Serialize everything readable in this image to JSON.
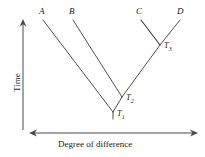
{
  "figure": {
    "type": "phylogenetic-tree",
    "stroke_color": "#3a3a3a",
    "text_color": "#1a1a1a",
    "background": "#ffffff"
  },
  "axes": {
    "vertical": {
      "label": "Time",
      "direction": "up",
      "arrow": "single",
      "x": 23,
      "y_top": 20,
      "y_bottom": 130
    },
    "horizontal": {
      "label": "Degree of difference",
      "direction": "both",
      "arrow": "double",
      "y": 133,
      "x_left": 30,
      "x_right": 197
    }
  },
  "taxa": [
    {
      "label": "A",
      "tip_x": 43,
      "tip_y": 20,
      "label_x": 39,
      "label_y": 8
    },
    {
      "label": "B",
      "tip_x": 73,
      "tip_y": 20,
      "label_x": 69,
      "label_y": 8
    },
    {
      "label": "C",
      "tip_x": 141,
      "tip_y": 20,
      "label_x": 136,
      "label_y": 8
    },
    {
      "label": "D",
      "tip_x": 180,
      "tip_y": 20,
      "label_x": 177,
      "label_y": 8
    }
  ],
  "nodes": [
    {
      "label": "T",
      "subscript": "1",
      "x": 113,
      "y": 112,
      "label_x": 116,
      "label_y": 112,
      "description": "root node joining A with the B-C-D clade"
    },
    {
      "label": "T",
      "subscript": "2",
      "x": 122,
      "y": 97,
      "label_x": 126,
      "label_y": 95,
      "description": "node joining B with the C-D clade"
    },
    {
      "label": "T",
      "subscript": "3",
      "x": 160,
      "y": 45,
      "label_x": 164,
      "label_y": 44,
      "description": "node joining C and D"
    }
  ],
  "branches": [
    {
      "name": "branch-A",
      "from": [
        43,
        20
      ],
      "to": [
        113,
        112
      ]
    },
    {
      "name": "branch-B",
      "from": [
        73,
        20
      ],
      "to": [
        122,
        97
      ]
    },
    {
      "name": "branch-C",
      "from": [
        141,
        20
      ],
      "to": [
        160,
        45
      ]
    },
    {
      "name": "branch-D",
      "from": [
        180,
        20
      ],
      "to": [
        160,
        45
      ]
    },
    {
      "name": "branch-T3-T2",
      "from": [
        160,
        45
      ],
      "to": [
        122,
        97
      ]
    },
    {
      "name": "branch-T2-T1",
      "from": [
        122,
        97
      ],
      "to": [
        113,
        112
      ]
    },
    {
      "name": "root-stem",
      "from": [
        113,
        112
      ],
      "to": [
        113,
        119
      ]
    }
  ]
}
